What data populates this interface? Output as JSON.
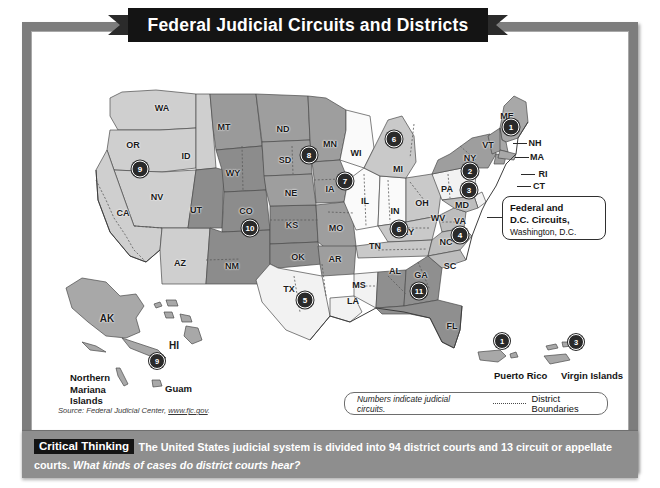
{
  "title": "Federal Judicial Circuits and Districts",
  "map": {
    "states": [
      {
        "abbr": "WA",
        "x": 152,
        "y": 58
      },
      {
        "abbr": "OR",
        "x": 123,
        "y": 95
      },
      {
        "abbr": "ID",
        "x": 176,
        "y": 106
      },
      {
        "abbr": "MT",
        "x": 214,
        "y": 77
      },
      {
        "abbr": "ND",
        "x": 273,
        "y": 79
      },
      {
        "abbr": "SD",
        "x": 275,
        "y": 110
      },
      {
        "abbr": "MN",
        "x": 320,
        "y": 94
      },
      {
        "abbr": "WI",
        "x": 346,
        "y": 103
      },
      {
        "abbr": "NV",
        "x": 147,
        "y": 147
      },
      {
        "abbr": "UT",
        "x": 186,
        "y": 160
      },
      {
        "abbr": "WY",
        "x": 223,
        "y": 123
      },
      {
        "abbr": "CO",
        "x": 236,
        "y": 161
      },
      {
        "abbr": "NE",
        "x": 281,
        "y": 143
      },
      {
        "abbr": "IA",
        "x": 320,
        "y": 139
      },
      {
        "abbr": "CA",
        "x": 113,
        "y": 163
      },
      {
        "abbr": "AZ",
        "x": 170,
        "y": 213
      },
      {
        "abbr": "NM",
        "x": 222,
        "y": 216
      },
      {
        "abbr": "KS",
        "x": 282,
        "y": 175
      },
      {
        "abbr": "MO",
        "x": 326,
        "y": 178
      },
      {
        "abbr": "IL",
        "x": 355,
        "y": 151
      },
      {
        "abbr": "IN",
        "x": 385,
        "y": 161
      },
      {
        "abbr": "MI",
        "x": 388,
        "y": 119
      },
      {
        "abbr": "OH",
        "x": 412,
        "y": 153
      },
      {
        "abbr": "KY",
        "x": 398,
        "y": 182
      },
      {
        "abbr": "WV",
        "x": 428,
        "y": 168
      },
      {
        "abbr": "VA",
        "x": 450,
        "y": 171
      },
      {
        "abbr": "PA",
        "x": 437,
        "y": 139
      },
      {
        "abbr": "MD",
        "x": 452,
        "y": 155
      },
      {
        "abbr": "NY",
        "x": 460,
        "y": 108
      },
      {
        "abbr": "OK",
        "x": 288,
        "y": 207
      },
      {
        "abbr": "AR",
        "x": 325,
        "y": 209
      },
      {
        "abbr": "TN",
        "x": 365,
        "y": 196
      },
      {
        "abbr": "NC",
        "x": 436,
        "y": 192
      },
      {
        "abbr": "SC",
        "x": 440,
        "y": 216
      },
      {
        "abbr": "TX",
        "x": 279,
        "y": 239
      },
      {
        "abbr": "LA",
        "x": 343,
        "y": 251
      },
      {
        "abbr": "MS",
        "x": 349,
        "y": 235
      },
      {
        "abbr": "AL",
        "x": 385,
        "y": 221
      },
      {
        "abbr": "GA",
        "x": 411,
        "y": 225
      },
      {
        "abbr": "FL",
        "x": 442,
        "y": 276
      },
      {
        "abbr": "VT",
        "x": 478,
        "y": 95
      },
      {
        "abbr": "ME",
        "x": 497,
        "y": 66
      }
    ],
    "leader_labels": [
      {
        "abbr": "NH",
        "x": 525,
        "y": 93
      },
      {
        "abbr": "MA",
        "x": 527,
        "y": 107
      },
      {
        "abbr": "RI",
        "x": 533,
        "y": 124
      },
      {
        "abbr": "CT",
        "x": 529,
        "y": 136
      },
      {
        "abbr": "NJ",
        "x": 527,
        "y": 150
      },
      {
        "abbr": "DE",
        "x": 527,
        "y": 163
      }
    ],
    "circuit_badges": [
      {
        "number": "9",
        "x": 130,
        "y": 119
      },
      {
        "number": "10",
        "x": 240,
        "y": 178
      },
      {
        "number": "8",
        "x": 299,
        "y": 105
      },
      {
        "number": "7",
        "x": 335,
        "y": 131
      },
      {
        "number": "6",
        "x": 384,
        "y": 89
      },
      {
        "number": "6",
        "x": 389,
        "y": 179
      },
      {
        "number": "5",
        "x": 295,
        "y": 250
      },
      {
        "number": "11",
        "x": 409,
        "y": 241
      },
      {
        "number": "1",
        "x": 501,
        "y": 77
      },
      {
        "number": "2",
        "x": 460,
        "y": 121
      },
      {
        "number": "3",
        "x": 459,
        "y": 140
      },
      {
        "number": "4",
        "x": 450,
        "y": 185
      }
    ]
  },
  "callout": {
    "line1": "Federal and",
    "line2": "D.C. Circuits,",
    "line3": "Washington, D.C."
  },
  "islands": [
    {
      "name": "AK",
      "x": 97,
      "y": 268,
      "kind": "state"
    },
    {
      "name": "HI",
      "x": 164,
      "y": 295,
      "kind": "state"
    },
    {
      "name": "Guam",
      "x": 155,
      "y": 333,
      "kind": "territory"
    },
    {
      "name": "Northern Mariana Islands",
      "x": 60,
      "y": 322,
      "kind": "territory-multi"
    },
    {
      "name": "Puerto Rico",
      "x": 484,
      "y": 320,
      "kind": "territory"
    },
    {
      "name": "Virgin Islands",
      "x": 551,
      "y": 320,
      "kind": "territory"
    }
  ],
  "island_badges": [
    {
      "number": "9",
      "x": 147,
      "y": 311
    },
    {
      "number": "1",
      "x": 492,
      "y": 291
    },
    {
      "number": "3",
      "x": 566,
      "y": 292
    }
  ],
  "source": {
    "prefix": "Source: Federal Judicial Center, ",
    "url": "www.fjc.gov",
    "suffix": "."
  },
  "legend": {
    "note": "Numbers indicate judicial circuits.",
    "boundaries_label": "District Boundaries"
  },
  "critical_thinking": {
    "tag": "Critical Thinking",
    "statement": "The United States judicial system is divided into 94 district courts and 13 circuit or appellate courts. ",
    "question": "What kinds of cases do district courts hear?"
  },
  "colors": {
    "frame": "#7d7d7d",
    "ribbon": "#141414",
    "badge": "#2a2a2a",
    "bar": "#8e8e8e"
  }
}
